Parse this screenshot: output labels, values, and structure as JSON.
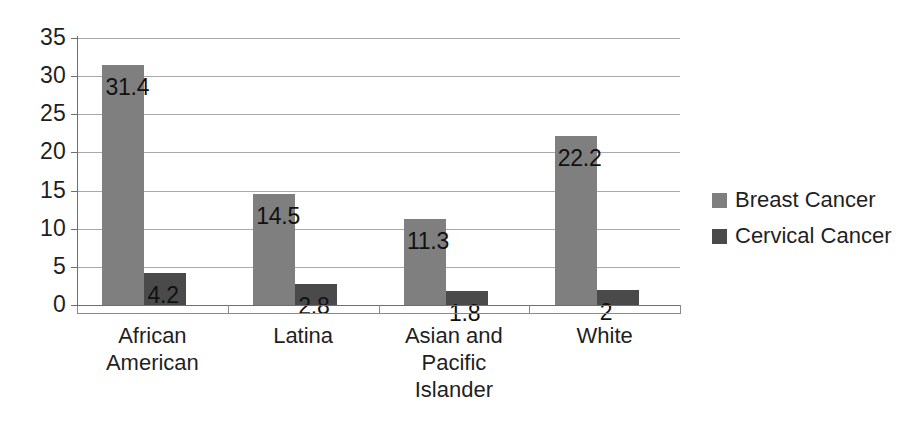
{
  "chart_data": {
    "type": "bar",
    "title": "",
    "subtitle": "",
    "xlabel": "",
    "ylabel": "",
    "ylim": [
      0,
      35
    ],
    "y_ticks": [
      0,
      5,
      10,
      15,
      20,
      25,
      30,
      35
    ],
    "y_tick_labels": [
      "0",
      "5",
      "10",
      "15",
      "20",
      "25",
      "30",
      "35"
    ],
    "grid": true,
    "legend_position": "right",
    "categories": [
      "African American",
      "Latina",
      "Asian and Pacific Islander",
      "White"
    ],
    "category_lines": [
      [
        "African",
        "American"
      ],
      [
        "Latina"
      ],
      [
        "Asian and",
        "Pacific",
        "Islander"
      ],
      [
        "White"
      ]
    ],
    "series": [
      {
        "name": "Breast Cancer",
        "color": "#7f7f7f",
        "values": [
          31.4,
          14.5,
          11.3,
          22.2
        ],
        "value_labels": [
          "31.4",
          "14.5",
          "11.3",
          "22.2"
        ]
      },
      {
        "name": "Cervical Cancer",
        "color": "#4a4a4a",
        "values": [
          4.2,
          2.8,
          1.8,
          2
        ],
        "value_labels": [
          "4.2",
          "2.8",
          "1.8",
          "2"
        ]
      }
    ]
  },
  "legend": {
    "items": [
      {
        "label": "Breast Cancer",
        "swatch": "breast"
      },
      {
        "label": "Cervical Cancer",
        "swatch": "cervical"
      }
    ]
  }
}
